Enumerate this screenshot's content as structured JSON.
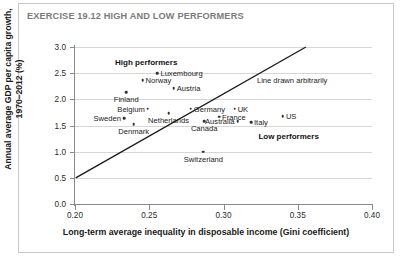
{
  "figure": {
    "exercise_title": "EXERCISE 19.12 HIGH AND LOW PERFORMERS"
  },
  "chart_data": {
    "type": "scatter",
    "title": "EXERCISE 19.12 HIGH AND LOW PERFORMERS",
    "xlabel": "Long-term average inequality in disposable income (Gini coefficient)",
    "ylabel": "Annual average GDP per capita growth, 1970–2012 (%)",
    "ylabel_line1": "Annual average GDP per capita growth,",
    "ylabel_line2": "1970–2012 (%)",
    "xlim": [
      0.2,
      0.4
    ],
    "ylim": [
      0.0,
      3.0
    ],
    "xticks": [
      "0.20",
      "0.25",
      "0.30",
      "0.35",
      "0.40"
    ],
    "xtick_values": [
      0.2,
      0.25,
      0.3,
      0.35,
      0.4
    ],
    "yticks": [
      "0.0",
      "0.5",
      "1.0",
      "1.5",
      "2.0",
      "2.5",
      "3.0"
    ],
    "ytick_values": [
      0.0,
      0.5,
      1.0,
      1.5,
      2.0,
      2.5,
      3.0
    ],
    "grid": true,
    "grid_axis": "y",
    "legend": "none",
    "points": [
      {
        "name": "Luxembourg",
        "x": 0.2555,
        "y": 2.5,
        "label_pos": "right"
      },
      {
        "name": "Norway",
        "x": 0.2455,
        "y": 2.36,
        "label_pos": "right"
      },
      {
        "name": "Austria",
        "x": 0.2665,
        "y": 2.21,
        "label_pos": "right"
      },
      {
        "name": "Finland",
        "x": 0.2345,
        "y": 2.14,
        "label_pos": "below"
      },
      {
        "name": "Germany",
        "x": 0.278,
        "y": 1.82,
        "label_pos": "right"
      },
      {
        "name": "Belgium",
        "x": 0.249,
        "y": 1.82,
        "label_pos": "left"
      },
      {
        "name": "Netherlands",
        "x": 0.263,
        "y": 1.74,
        "label_pos": "below"
      },
      {
        "name": "Sweden",
        "x": 0.233,
        "y": 1.64,
        "label_pos": "left"
      },
      {
        "name": "Denmark",
        "x": 0.2395,
        "y": 1.52,
        "label_pos": "below"
      },
      {
        "name": "UK",
        "x": 0.3075,
        "y": 1.82,
        "label_pos": "right"
      },
      {
        "name": "France",
        "x": 0.297,
        "y": 1.67,
        "label_pos": "right"
      },
      {
        "name": "Canada",
        "x": 0.287,
        "y": 1.58,
        "label_pos": "below"
      },
      {
        "name": "Australia",
        "x": 0.3095,
        "y": 1.58,
        "label_pos": "left"
      },
      {
        "name": "Italy",
        "x": 0.3185,
        "y": 1.56,
        "label_pos": "right"
      },
      {
        "name": "US",
        "x": 0.34,
        "y": 1.68,
        "label_pos": "right"
      },
      {
        "name": "Switzerland",
        "x": 0.2865,
        "y": 1.0,
        "label_pos": "below"
      }
    ],
    "annotations": [
      {
        "text": "High performers",
        "x": 0.227,
        "y": 2.72
      },
      {
        "text": "Low performers",
        "x": 0.3235,
        "y": 1.3
      },
      {
        "text": "Line drawn arbitrarily",
        "x": 0.3225,
        "y": 2.37
      }
    ],
    "trend_line": {
      "label": "Line drawn arbitrarily",
      "x0": 0.2005,
      "y0": 0.5,
      "x1": 0.3555,
      "y1": 3.0
    }
  }
}
